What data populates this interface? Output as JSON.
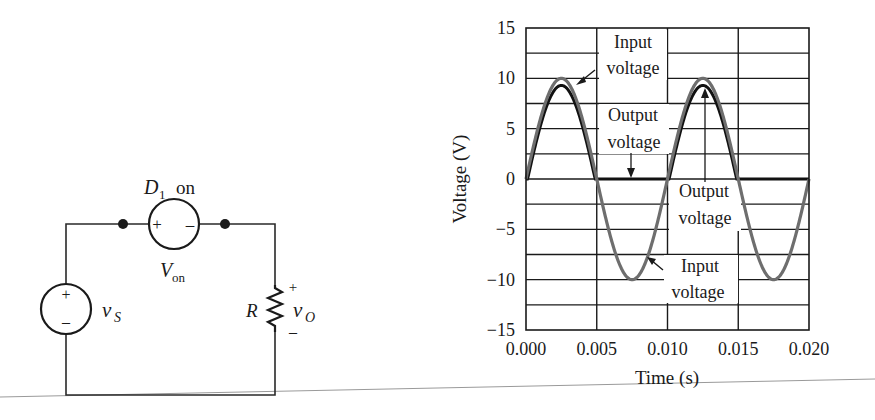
{
  "circuit": {
    "diode_label": "D",
    "diode_subscript": "1",
    "diode_state": "on",
    "diode_plus": "+",
    "diode_minus": "–",
    "von_label": "V",
    "von_subscript": "on",
    "source_label": "v",
    "source_subscript": "S",
    "source_plus": "+",
    "source_minus": "–",
    "resistor_label": "R",
    "output_label": "v",
    "output_subscript": "O",
    "output_plus": "+",
    "output_minus": "–"
  },
  "chart_data": {
    "type": "line",
    "title": "",
    "xlabel": "Time (s)",
    "ylabel": "Voltage (V)",
    "xlim": [
      0.0,
      0.02
    ],
    "ylim": [
      -15,
      15
    ],
    "x_ticks": [
      "0.000",
      "0.005",
      "0.010",
      "0.015",
      "0.020"
    ],
    "y_ticks": [
      "15",
      "10",
      "5",
      "0",
      "−5",
      "−10",
      "−15"
    ],
    "grid": true,
    "series": [
      {
        "name": "Input voltage",
        "description": "10 sin(2π·100·t) V",
        "amplitude": 10,
        "frequency_hz": 100,
        "color": "#6e6e6e",
        "x": [
          0.0,
          0.0025,
          0.005,
          0.0075,
          0.01,
          0.0125,
          0.015,
          0.0175,
          0.02
        ],
        "values": [
          0,
          10,
          0,
          -10,
          0,
          10,
          0,
          -10,
          0
        ]
      },
      {
        "name": "Output voltage",
        "description": "half-wave rectified, peak ≈ 9.3 V (input minus Von where input > Von, else 0)",
        "von": 0.7,
        "color": "#111111",
        "x": [
          0.0,
          0.0025,
          0.005,
          0.0075,
          0.01,
          0.0125,
          0.015,
          0.0175,
          0.02
        ],
        "values": [
          0,
          9.3,
          0,
          0,
          0,
          9.3,
          0,
          0,
          0
        ]
      }
    ],
    "annotations": [
      {
        "line1": "Input",
        "line2": "voltage",
        "points_to": "input peak 1"
      },
      {
        "line1": "Output",
        "line2": "voltage",
        "points_to": "output zero segment"
      },
      {
        "line1": "Output",
        "line2": "voltage",
        "points_to": "output peak 2"
      },
      {
        "line1": "Input",
        "line2": "voltage",
        "points_to": "input negative half-cycle"
      }
    ]
  }
}
